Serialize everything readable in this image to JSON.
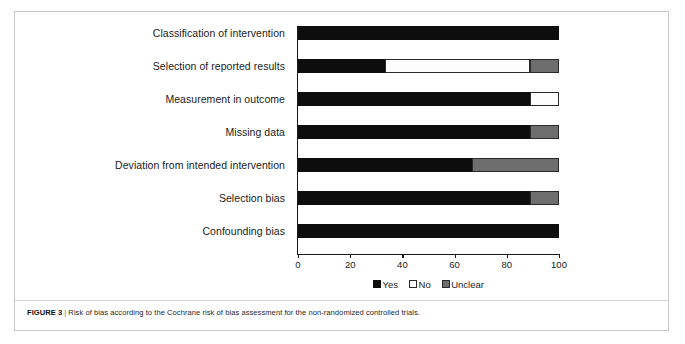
{
  "figure": {
    "caption_label": "FIGURE 3",
    "caption_separator": "|",
    "caption_text": "Risk of bias according to the Cochrane risk of bias assessment for the non-randomized controlled trials."
  },
  "chart_data": {
    "type": "bar",
    "orientation": "horizontal",
    "stacked": true,
    "percent": true,
    "title": "",
    "xlabel": "",
    "ylabel": "",
    "xlim": [
      0,
      100
    ],
    "xticks": [
      "0",
      "20",
      "40",
      "60",
      "80",
      "100"
    ],
    "grid": false,
    "legend_position": "bottom",
    "categories": [
      "Classification of intervention",
      "Selection of reported results",
      "Measurement in outcome",
      "Missing data",
      "Deviation from intended intervention",
      "Selection bias",
      "Confounding bias"
    ],
    "series": [
      {
        "name": "Yes",
        "color": "#0d0d0d",
        "values": [
          100,
          33.3,
          88.9,
          88.9,
          66.7,
          88.9,
          100
        ]
      },
      {
        "name": "No",
        "color": "#ffffff",
        "values": [
          0,
          55.6,
          11.1,
          0,
          0,
          0,
          0
        ]
      },
      {
        "name": "Unclear",
        "color": "#6e6e6e",
        "values": [
          0,
          11.1,
          0,
          11.1,
          33.3,
          11.1,
          0
        ]
      }
    ],
    "legend": [
      {
        "label": "Yes",
        "swatch": "black"
      },
      {
        "label": "No",
        "swatch": "white"
      },
      {
        "label": "Unclear",
        "swatch": "gray"
      }
    ]
  }
}
